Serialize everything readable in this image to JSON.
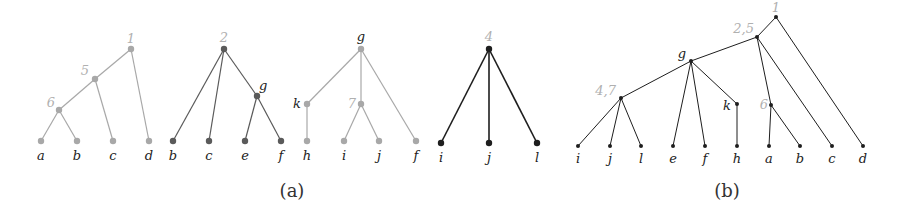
{
  "colors": {
    "light": "#a8a8a8",
    "medium": "#5a5a5a",
    "dark": "#1e1e1e",
    "label_dark": "#222222",
    "label_light": "#b0b0b0"
  },
  "panels": [
    {
      "caption": "(a)",
      "trees": [
        {
          "id": "tree-1",
          "tone": "light",
          "nodes": [
            {
              "id": "n1",
              "label": "1",
              "label_tone": "light",
              "kind": "internal"
            },
            {
              "id": "n5",
              "label": "5",
              "label_tone": "light",
              "kind": "internal"
            },
            {
              "id": "n6",
              "label": "6",
              "label_tone": "light",
              "kind": "internal"
            },
            {
              "id": "a",
              "label": "a",
              "kind": "leaf"
            },
            {
              "id": "b",
              "label": "b",
              "kind": "leaf"
            },
            {
              "id": "c",
              "label": "c",
              "kind": "leaf"
            },
            {
              "id": "d",
              "label": "d",
              "kind": "leaf"
            }
          ],
          "edges": [
            [
              "n1",
              "n5"
            ],
            [
              "n1",
              "d"
            ],
            [
              "n5",
              "n6"
            ],
            [
              "n5",
              "c"
            ],
            [
              "n6",
              "a"
            ],
            [
              "n6",
              "b"
            ]
          ]
        },
        {
          "id": "tree-2",
          "tone": "medium",
          "nodes": [
            {
              "id": "n2",
              "label": "2",
              "label_tone": "light",
              "kind": "internal"
            },
            {
              "id": "g",
              "label": "g",
              "label_tone": "dark",
              "kind": "internal"
            },
            {
              "id": "b",
              "label": "b",
              "kind": "leaf"
            },
            {
              "id": "c",
              "label": "c",
              "kind": "leaf"
            },
            {
              "id": "e",
              "label": "e",
              "kind": "leaf"
            },
            {
              "id": "f",
              "label": "f",
              "kind": "leaf"
            }
          ],
          "edges": [
            [
              "n2",
              "b"
            ],
            [
              "n2",
              "c"
            ],
            [
              "n2",
              "g"
            ],
            [
              "g",
              "e"
            ],
            [
              "g",
              "f"
            ]
          ]
        },
        {
          "id": "tree-3",
          "tone": "light",
          "nodes": [
            {
              "id": "g",
              "label": "g",
              "label_tone": "dark",
              "kind": "internal"
            },
            {
              "id": "k",
              "label": "k",
              "label_tone": "dark",
              "kind": "internal"
            },
            {
              "id": "n7",
              "label": "7",
              "label_tone": "light",
              "kind": "internal"
            },
            {
              "id": "h",
              "label": "h",
              "kind": "leaf"
            },
            {
              "id": "i",
              "label": "i",
              "kind": "leaf"
            },
            {
              "id": "j",
              "label": "j",
              "kind": "leaf"
            },
            {
              "id": "f",
              "label": "f",
              "kind": "leaf"
            }
          ],
          "edges": [
            [
              "g",
              "k"
            ],
            [
              "g",
              "n7"
            ],
            [
              "g",
              "f"
            ],
            [
              "k",
              "h"
            ],
            [
              "n7",
              "i"
            ],
            [
              "n7",
              "j"
            ]
          ]
        },
        {
          "id": "tree-4",
          "tone": "dark",
          "nodes": [
            {
              "id": "n4",
              "label": "4",
              "label_tone": "light",
              "kind": "internal"
            },
            {
              "id": "i",
              "label": "i",
              "kind": "leaf"
            },
            {
              "id": "j",
              "label": "j",
              "kind": "leaf"
            },
            {
              "id": "l",
              "label": "l",
              "kind": "leaf"
            }
          ],
          "edges": [
            [
              "n4",
              "i"
            ],
            [
              "n4",
              "j"
            ],
            [
              "n4",
              "l"
            ]
          ]
        }
      ]
    },
    {
      "caption": "(b)",
      "trees": [
        {
          "id": "tree-combined",
          "tone": "dark",
          "nodes": [
            {
              "id": "n1",
              "label": "1",
              "label_tone": "light",
              "kind": "internal"
            },
            {
              "id": "n25",
              "label": "2,5",
              "label_tone": "light",
              "kind": "internal"
            },
            {
              "id": "g",
              "label": "g",
              "label_tone": "dark",
              "kind": "internal"
            },
            {
              "id": "n47",
              "label": "4,7",
              "label_tone": "light",
              "kind": "internal"
            },
            {
              "id": "k",
              "label": "k",
              "label_tone": "dark",
              "kind": "internal"
            },
            {
              "id": "n6",
              "label": "6",
              "label_tone": "light",
              "kind": "internal"
            },
            {
              "id": "i",
              "label": "i",
              "kind": "leaf"
            },
            {
              "id": "j",
              "label": "j",
              "kind": "leaf"
            },
            {
              "id": "l",
              "label": "l",
              "kind": "leaf"
            },
            {
              "id": "e",
              "label": "e",
              "kind": "leaf"
            },
            {
              "id": "f",
              "label": "f",
              "kind": "leaf"
            },
            {
              "id": "h",
              "label": "h",
              "kind": "leaf"
            },
            {
              "id": "a",
              "label": "a",
              "kind": "leaf"
            },
            {
              "id": "b",
              "label": "b",
              "kind": "leaf"
            },
            {
              "id": "c",
              "label": "c",
              "kind": "leaf"
            },
            {
              "id": "d",
              "label": "d",
              "kind": "leaf"
            }
          ],
          "edges": [
            [
              "n1",
              "n25"
            ],
            [
              "n1",
              "d"
            ],
            [
              "n25",
              "g"
            ],
            [
              "n25",
              "n6"
            ],
            [
              "n25",
              "c"
            ],
            [
              "g",
              "n47"
            ],
            [
              "g",
              "e"
            ],
            [
              "g",
              "f"
            ],
            [
              "g",
              "k"
            ],
            [
              "n47",
              "i"
            ],
            [
              "n47",
              "j"
            ],
            [
              "n47",
              "l"
            ],
            [
              "k",
              "h"
            ],
            [
              "n6",
              "a"
            ],
            [
              "n6",
              "b"
            ]
          ]
        }
      ]
    }
  ]
}
